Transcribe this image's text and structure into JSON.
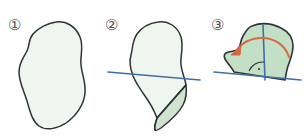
{
  "figure": {
    "width": 308,
    "height": 138,
    "background_color": "#ffffff"
  },
  "colors": {
    "outline": "#2f3335",
    "fill_light": "#eef6ef",
    "fill_flap": "#cfe4d0",
    "fill_rotated": "#c3e0c6",
    "axis_line": "#3f6fa8",
    "arrow": "#d9673f",
    "label_text": "#555050"
  },
  "panels": [
    {
      "id": "panel-1",
      "step_label": "①",
      "step_number": "1",
      "caption": "",
      "shape_name": "blob-outline",
      "shape_fill": "#eef6ef",
      "has_axis_line": false,
      "has_arrow": false,
      "has_fold": false
    },
    {
      "id": "panel-2",
      "step_label": "②",
      "step_number": "2",
      "caption": "",
      "shape_name": "blob-with-fold",
      "shape_fill": "#eef6ef",
      "flap_fill": "#cfe4d0",
      "has_axis_line": true,
      "axis_line_color": "#3f6fa8",
      "has_arrow": false,
      "has_fold": true
    },
    {
      "id": "panel-3",
      "step_label": "③",
      "step_number": "3",
      "caption": "",
      "shape_name": "blob-rotated",
      "shape_fill": "#c3e0c6",
      "has_axis_line": true,
      "axis_line_color": "#3f6fa8",
      "has_arrow": true,
      "arrow_color": "#d9673f",
      "arrow_direction": "counter-clockwise",
      "has_right_angle_marker": true,
      "has_fold": false
    }
  ]
}
